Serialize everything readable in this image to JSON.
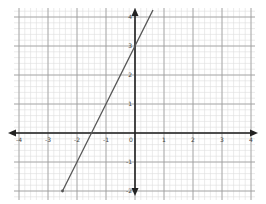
{
  "chart_data": {
    "type": "line",
    "title": "",
    "xlabel": "",
    "ylabel": "",
    "xlim": [
      -4,
      4
    ],
    "ylim": [
      -2,
      4
    ],
    "grid": true,
    "grid_minor_per_unit": 5,
    "x_ticks": [
      "-4",
      "-3",
      "-2",
      "-1",
      "0",
      "1",
      "2",
      "3",
      "4"
    ],
    "y_ticks": [
      "-2",
      "-1",
      "0",
      "1",
      "2",
      "3",
      "4"
    ],
    "series": [
      {
        "name": "y = 2x + 3",
        "equation": "y = 2x + 3",
        "slope": 2,
        "intercept": 3,
        "x": [
          -2.5,
          0.62
        ],
        "y": [
          -2,
          4.24
        ],
        "color": "#555555"
      }
    ],
    "x_intercept": -1.5,
    "y_intercept": 3
  },
  "colors": {
    "axis": "#222222",
    "major_grid": "#9a9a9a",
    "minor_grid": "#dddddd",
    "line": "#555555"
  }
}
